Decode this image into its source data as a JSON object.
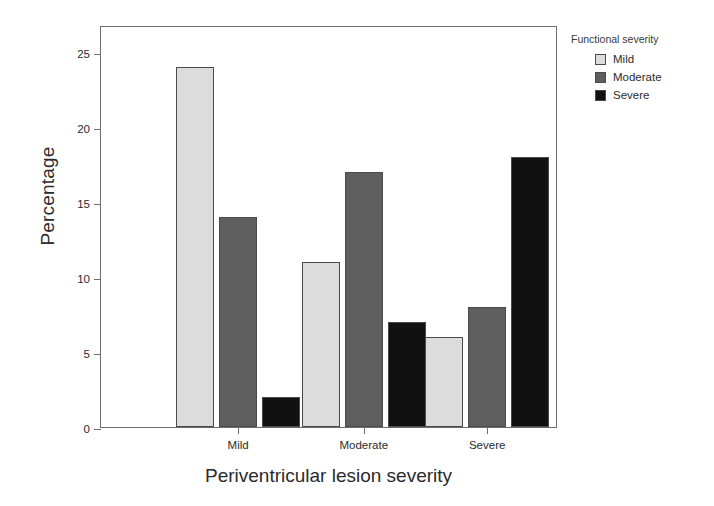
{
  "chart_data": {
    "type": "bar",
    "title": "",
    "xlabel": "Periventricular lesion severity",
    "ylabel": "Percentage",
    "categories": [
      "Mild",
      "Moderate",
      "Severe"
    ],
    "series": [
      {
        "name": "Mild",
        "values": [
          24,
          11,
          6
        ],
        "color": "#dcdcdc"
      },
      {
        "name": "Moderate",
        "values": [
          14,
          17,
          8
        ],
        "color": "#5e5e5e"
      },
      {
        "name": "Severe",
        "values": [
          2,
          7,
          18
        ],
        "color": "#111111"
      }
    ],
    "ylim": [
      0,
      26.8
    ],
    "yticks": [
      0,
      5,
      10,
      15,
      20,
      25
    ],
    "ytick_labels": [
      "0",
      "5",
      "10",
      "15",
      "20",
      "25"
    ],
    "grid": false,
    "legend": {
      "title": "Functional severity",
      "position": "right",
      "entries": [
        "Mild",
        "Moderate",
        "Severe"
      ]
    }
  },
  "legend": {
    "title": "Functional severity",
    "items": [
      {
        "label": "Mild",
        "swatch": "legend-swatch-mild"
      },
      {
        "label": "Moderate",
        "swatch": "legend-swatch-moderate"
      },
      {
        "label": "Severe",
        "swatch": "legend-swatch-severe"
      }
    ]
  },
  "axes": {
    "y_title": "Percentage",
    "x_title": "Periventricular lesion severity",
    "y_tick_labels": [
      "0",
      "5",
      "10",
      "15",
      "20",
      "25"
    ],
    "x_tick_labels": [
      "Mild",
      "Moderate",
      "Severe"
    ]
  }
}
